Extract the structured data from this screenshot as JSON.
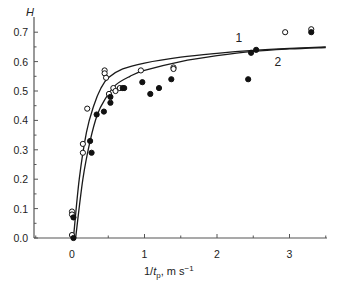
{
  "chart_data": {
    "type": "scatter",
    "title": "",
    "xlabel": "1/t_p, m s^-1",
    "xlabel_parts": {
      "pre": "1/",
      "var": "t",
      "sub": "p",
      "post": ", m s",
      "sup": "−1"
    },
    "ylabel": "H",
    "xlim": [
      -0.5,
      3.5
    ],
    "ylim": [
      0.0,
      0.72
    ],
    "x_ticks": [
      0,
      1,
      2,
      3
    ],
    "x_tick_labels": [
      "0",
      "1",
      "2",
      "3"
    ],
    "y_ticks": [
      0.0,
      0.1,
      0.2,
      0.3,
      0.4,
      0.5,
      0.6,
      0.7
    ],
    "y_tick_labels": [
      "0.0",
      "0.1",
      "0.2",
      "0.3",
      "0.4",
      "0.5",
      "0.6",
      "0.7"
    ],
    "grid": false,
    "legend": null,
    "annotations": [
      {
        "text": "1",
        "x": 2.3,
        "y": 0.68
      },
      {
        "text": "2",
        "x": 2.84,
        "y": 0.6
      }
    ],
    "series": [
      {
        "name": "open circles",
        "marker": "open-circle",
        "points": [
          [
            0.0,
            0.09
          ],
          [
            0.0,
            0.08
          ],
          [
            0.0,
            0.01
          ],
          [
            0.15,
            0.32
          ],
          [
            0.15,
            0.29
          ],
          [
            0.21,
            0.44
          ],
          [
            0.45,
            0.57
          ],
          [
            0.45,
            0.56
          ],
          [
            0.47,
            0.545
          ],
          [
            0.51,
            0.49
          ],
          [
            0.57,
            0.51
          ],
          [
            0.6,
            0.5
          ],
          [
            0.66,
            0.51
          ],
          [
            0.95,
            0.57
          ],
          [
            1.4,
            0.58
          ],
          [
            1.4,
            0.575
          ],
          [
            2.94,
            0.7
          ],
          [
            3.3,
            0.71
          ]
        ]
      },
      {
        "name": "filled circles",
        "marker": "filled-circle",
        "points": [
          [
            0.02,
            0.07
          ],
          [
            0.02,
            0.0
          ],
          [
            0.25,
            0.33
          ],
          [
            0.27,
            0.29
          ],
          [
            0.34,
            0.42
          ],
          [
            0.44,
            0.43
          ],
          [
            0.53,
            0.46
          ],
          [
            0.53,
            0.48
          ],
          [
            0.7,
            0.51
          ],
          [
            0.72,
            0.51
          ],
          [
            0.97,
            0.53
          ],
          [
            1.08,
            0.49
          ],
          [
            1.2,
            0.51
          ],
          [
            1.37,
            0.54
          ],
          [
            2.43,
            0.54
          ],
          [
            2.47,
            0.63
          ],
          [
            2.54,
            0.64
          ],
          [
            3.3,
            0.7
          ]
        ]
      },
      {
        "name": "1",
        "type": "line",
        "x": [
          0.02,
          0.1,
          0.2,
          0.3,
          0.4,
          0.5,
          0.7,
          1.0,
          1.5,
          2.0,
          2.5,
          3.0,
          3.5
        ],
        "y": [
          0.0,
          0.2,
          0.36,
          0.45,
          0.51,
          0.545,
          0.575,
          0.595,
          0.615,
          0.628,
          0.638,
          0.645,
          0.65
        ]
      },
      {
        "name": "2",
        "type": "line",
        "x": [
          0.05,
          0.15,
          0.25,
          0.35,
          0.45,
          0.6,
          0.8,
          1.0,
          1.5,
          2.0,
          2.5,
          3.0,
          3.5
        ],
        "y": [
          0.0,
          0.2,
          0.33,
          0.42,
          0.47,
          0.52,
          0.55,
          0.57,
          0.6,
          0.62,
          0.635,
          0.643,
          0.648
        ]
      }
    ]
  }
}
